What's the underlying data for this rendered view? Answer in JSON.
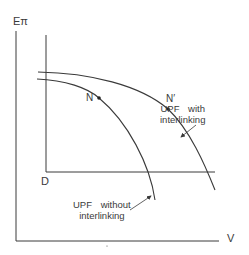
{
  "figure": {
    "y_axis_label": "Eπ",
    "x_axis_label": "V",
    "origin_label": "D",
    "points": [
      {
        "label": "N",
        "x": 99,
        "y": 98
      },
      {
        "label": "N′",
        "x": 168,
        "y": 109
      }
    ],
    "curves": [
      {
        "name": "UPF with interlinking",
        "label_line1": "UPF with",
        "label_line2": "interlinking",
        "point": "N′"
      },
      {
        "name": "UPF without interlinking",
        "label_line1": "UPF without",
        "label_line2": "interlinking",
        "point": "N"
      }
    ],
    "colors": {
      "line": "#3a3a3a",
      "background": "#ffffff"
    }
  }
}
